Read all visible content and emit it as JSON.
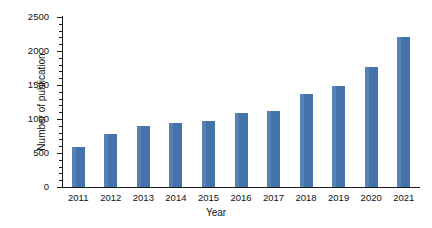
{
  "chart_data": {
    "type": "bar",
    "title": "",
    "xlabel": "Year",
    "ylabel": "Number of publication",
    "categories": [
      "2011",
      "2012",
      "2013",
      "2014",
      "2015",
      "2016",
      "2017",
      "2018",
      "2019",
      "2020",
      "2021"
    ],
    "values": [
      590,
      780,
      900,
      935,
      970,
      1090,
      1120,
      1375,
      1485,
      1760,
      2210
    ],
    "ylim": [
      0,
      2500
    ],
    "ytick_labels": [
      "0",
      "500",
      "1000",
      "1500",
      "2000",
      "2500"
    ],
    "ytick_values": [
      0,
      500,
      1000,
      1500,
      2000,
      2500
    ],
    "yminor_step": 100,
    "grid": false,
    "legend": false,
    "bar_color": "#4472ab",
    "axis_color": "#1a1a1a",
    "background": "#ffffff"
  }
}
